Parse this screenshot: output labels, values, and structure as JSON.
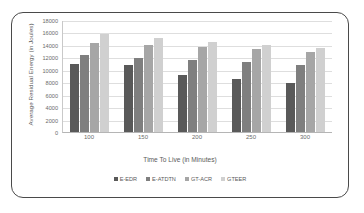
{
  "chart_data": {
    "type": "bar",
    "title": "",
    "xlabel": "Time To Live (in Minutes)",
    "ylabel": "Average Residual Energy (in Joules)",
    "categories": [
      "100",
      "150",
      "200",
      "250",
      "300"
    ],
    "ylim": [
      0,
      18000
    ],
    "yticks": [
      0,
      2000,
      4000,
      6000,
      8000,
      10000,
      12000,
      14000,
      16000,
      18000
    ],
    "ytick_labels": [
      "0",
      "2000",
      "4000",
      "6000",
      "8000",
      "10000",
      "12000",
      "14000",
      "16000",
      "18000"
    ],
    "grid": "horizontal",
    "legend_position": "bottom",
    "series": [
      {
        "name": "E-EDR",
        "color": "#595959",
        "values": [
          11000,
          10800,
          9250,
          8600,
          7900
        ]
      },
      {
        "name": "E-ATDTN",
        "color": "#7f7f7f",
        "values": [
          12500,
          12050,
          11750,
          11350,
          10900
        ]
      },
      {
        "name": "GT-ACR",
        "color": "#a6a6a6",
        "values": [
          14500,
          14100,
          13800,
          13450,
          13050
        ]
      },
      {
        "name": "GTEER",
        "color": "#d0d0d0",
        "values": [
          15900,
          15250,
          14650,
          14100,
          13600
        ]
      }
    ]
  }
}
